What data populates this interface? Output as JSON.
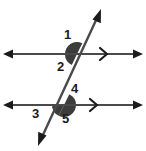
{
  "figure": {
    "colors": {
      "line": "#4a4a4a",
      "arrowhead": "#1b1b1b",
      "shading": "#3c3c3c",
      "label": "#1b1b1b",
      "background": "#ffffff"
    },
    "lines": [
      {
        "name": "upper-parallel-line",
        "orientation": "horizontal",
        "y": 54,
        "x_start": 4,
        "x_end": 142,
        "arrows": "both",
        "parallel_tick": ">"
      },
      {
        "name": "lower-parallel-line",
        "orientation": "horizontal",
        "y": 105,
        "x_start": 4,
        "x_end": 142,
        "arrows": "both",
        "parallel_tick": ">"
      },
      {
        "name": "transversal-line",
        "orientation": "diagonal",
        "x_start": 38,
        "y_start": 146,
        "x_end": 101,
        "y_end": 9,
        "arrows": "both"
      }
    ],
    "intersections": [
      {
        "name": "upper-intersection",
        "x": 77,
        "y": 54
      },
      {
        "name": "lower-intersection",
        "x": 64,
        "y": 105
      }
    ],
    "angles": [
      {
        "label": "1",
        "position": "above-left of upper intersection",
        "shaded": true
      },
      {
        "label": "2",
        "position": "below-left of upper intersection",
        "shaded": true
      },
      {
        "label": "4",
        "position": "above-right of lower intersection",
        "shaded": true
      },
      {
        "label": "3",
        "position": "below-left of lower intersection",
        "shaded": true
      },
      {
        "label": "5",
        "position": "below-right of lower intersection",
        "shaded": true
      }
    ],
    "labels": {
      "one": "1",
      "two": "2",
      "three": "3",
      "four": "4",
      "five": "5"
    }
  }
}
